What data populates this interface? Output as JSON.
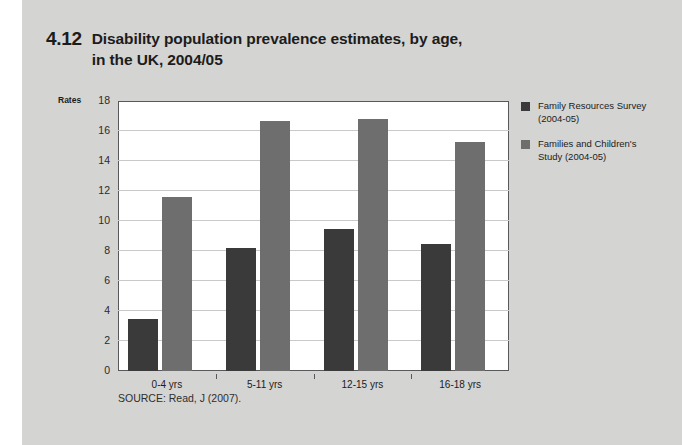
{
  "figure": {
    "number": "4.12",
    "title": "Disability population prevalence estimates, by age, in the UK, 2004/05",
    "title_line_1": "Disability population prevalence estimates, by age,",
    "title_line_2": "in the UK, 2004/05",
    "source": "SOURCE: Read, J (2007).",
    "background_color": "#d4d4d2"
  },
  "chart_data": {
    "type": "bar",
    "title": "Disability population prevalence estimates, by age, in the UK, 2004/05",
    "xlabel": "",
    "ylabel": "Rates",
    "categories": [
      "0-4 yrs",
      "5-11 yrs",
      "12-15 yrs",
      "16-18 yrs"
    ],
    "series": [
      {
        "name": "Family Resources Survey (2004-05)",
        "color": "#3a3a3a",
        "values": [
          3.5,
          8.2,
          9.5,
          8.5
        ]
      },
      {
        "name": "Families and Children's Study (2004-05)",
        "color": "#6e6e6e",
        "values": [
          11.6,
          16.7,
          16.8,
          15.3
        ]
      }
    ],
    "ylim": [
      0,
      18
    ],
    "yticks": [
      0,
      2,
      4,
      6,
      8,
      10,
      12,
      14,
      16,
      18
    ],
    "ytick_labels": [
      "0",
      "2",
      "4",
      "6",
      "8",
      "10",
      "12",
      "14",
      "16",
      "18"
    ],
    "grid": true,
    "legend_position": "right"
  },
  "legend": {
    "items": [
      {
        "color": "#3a3a3a",
        "line_1": "Family Resources Survey",
        "line_2": "(2004-05)"
      },
      {
        "color": "#6e6e6e",
        "line_1": "Families and Children's",
        "line_2": "Study (2004-05)"
      }
    ]
  }
}
